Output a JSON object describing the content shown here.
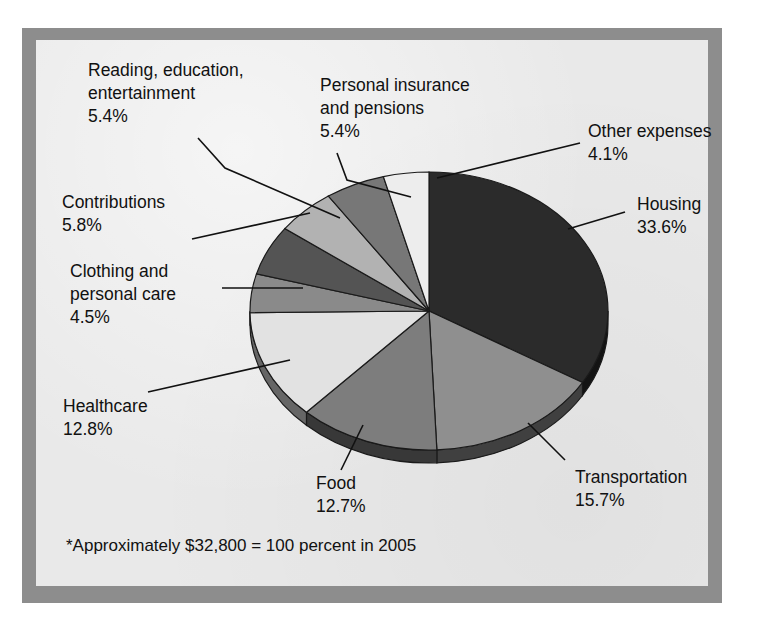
{
  "figure": {
    "name": "household-spending-pie",
    "footnote": "*Approximately $32,800 = 100 percent in 2005",
    "background_color": "#e9e9e9",
    "frame_color": "#8d8d8d"
  },
  "chart_data": {
    "type": "pie",
    "title": "",
    "units": "percent",
    "total_label": "*Approximately $32,800 = 100 percent in 2005",
    "total_value": 32800,
    "year": 2005,
    "legend": "none-external-labels",
    "start_angle_deg": 0,
    "direction": "clockwise",
    "categories": [
      "Housing",
      "Transportation",
      "Food",
      "Healthcare",
      "Clothing and personal care",
      "Contributions",
      "Reading, education, entertainment",
      "Personal insurance and pensions",
      "Other expenses"
    ],
    "values": [
      33.6,
      15.7,
      12.7,
      12.8,
      4.5,
      5.8,
      5.4,
      5.4,
      4.1
    ],
    "value_labels": [
      "33.6%",
      "15.7%",
      "12.7%",
      "12.8%",
      "4.5%",
      "5.8%",
      "5.4%",
      "5.4%",
      "4.1%"
    ],
    "colors": [
      "#2b2b2b",
      "#8f8f8f",
      "#7d7d7d",
      "#e2e2e2",
      "#8a8a8a",
      "#545454",
      "#b2b2b2",
      "#777777",
      "#ededed"
    ]
  },
  "labels": {
    "reading": {
      "line1": "Reading, education,",
      "line2": "entertainment",
      "value": "5.4%"
    },
    "personal_insurance": {
      "line1": "Personal insurance",
      "line2": "and pensions",
      "value": "5.4%"
    },
    "other_expenses": {
      "line1": "Other expenses",
      "value": "4.1%"
    },
    "housing": {
      "line1": "Housing",
      "value": "33.6%"
    },
    "contributions": {
      "line1": "Contributions",
      "value": "5.8%"
    },
    "clothing": {
      "line1": "Clothing and",
      "line2": "personal care",
      "value": "4.5%"
    },
    "healthcare": {
      "line1": "Healthcare",
      "value": "12.8%"
    },
    "food": {
      "line1": "Food",
      "value": "12.7%"
    },
    "transportation": {
      "line1": "Transportation",
      "value": "15.7%"
    }
  }
}
